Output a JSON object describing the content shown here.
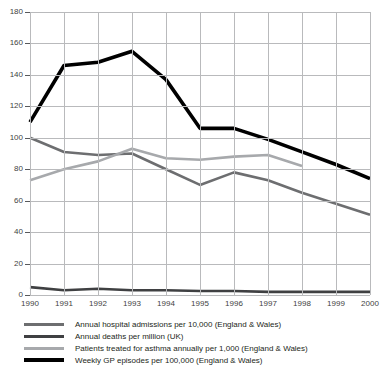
{
  "chart_data": {
    "type": "line",
    "title": "",
    "xlabel": "",
    "ylabel": "",
    "x": [
      1990,
      1991,
      1992,
      1993,
      1994,
      1995,
      1996,
      1997,
      1998,
      1999,
      2000
    ],
    "xlim": [
      1990,
      2000
    ],
    "ylim": [
      0,
      180
    ],
    "yticks": [
      0,
      20,
      40,
      60,
      80,
      100,
      120,
      140,
      160,
      180
    ],
    "xticks": [
      "1990",
      "1991",
      "1992",
      "1993",
      "1994",
      "1995",
      "1996",
      "1997",
      "1998",
      "1999",
      "2000"
    ],
    "grid": true,
    "legend_position": "bottom-left",
    "series": [
      {
        "name": "Annual hospital admissions per 10,000 (England & Wales)",
        "color": "#6d6e70",
        "width": 2.6,
        "x": [
          1990,
          1991,
          1992,
          1993,
          1994,
          1995,
          1996,
          1997,
          1998,
          1999,
          2000
        ],
        "values": [
          100,
          91,
          89,
          90,
          80,
          70,
          78,
          73,
          65,
          58,
          51
        ]
      },
      {
        "name": "Annual deaths per million (UK)",
        "color": "#3f4042",
        "width": 2.6,
        "x": [
          1990,
          1991,
          1992,
          1993,
          1994,
          1995,
          1996,
          1997,
          1998,
          1999,
          2000
        ],
        "values": [
          5,
          3,
          4,
          3,
          3,
          2.5,
          2.5,
          2,
          2,
          2,
          2
        ]
      },
      {
        "name": "Patients treated for asthma annually per 1,000 (England & Wales)",
        "color": "#a7a9ac",
        "width": 2.6,
        "x": [
          1990,
          1991,
          1992,
          1993,
          1994,
          1995,
          1996,
          1997,
          1998
        ],
        "values": [
          73,
          80,
          85,
          93,
          87,
          86,
          88,
          89,
          82
        ]
      },
      {
        "name": "Weekly GP episodes per 100,000 (England & Wales)",
        "color": "#000000",
        "width": 3.6,
        "x": [
          1990,
          1991,
          1992,
          1993,
          1994,
          1995,
          1996,
          1997,
          1998,
          1999,
          2000
        ],
        "values": [
          110,
          146,
          148,
          155,
          137,
          106,
          106,
          99,
          91,
          83,
          74
        ]
      }
    ]
  },
  "legend": {
    "items": [
      {
        "label": "Annual hospital admissions per 10,000 (England & Wales)",
        "color": "#6d6e70",
        "thickness": 3
      },
      {
        "label": "Annual deaths per million (UK)",
        "color": "#3f4042",
        "thickness": 3
      },
      {
        "label": "Patients treated for asthma annually per 1,000 (England & Wales)",
        "color": "#a7a9ac",
        "thickness": 3
      },
      {
        "label": "Weekly GP episodes per 100,000 (England & Wales)",
        "color": "#000000",
        "thickness": 4
      }
    ]
  }
}
